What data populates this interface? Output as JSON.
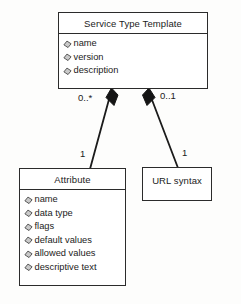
{
  "diagram": {
    "type": "uml-class-diagram",
    "background_color": "#fdfdfc",
    "line_color": "#2b2b2b",
    "text_color": "#1b1b1b",
    "classes": [
      {
        "id": "service-type-template",
        "name": "Service Type Template",
        "attributes": [
          "name",
          "version",
          "description"
        ]
      },
      {
        "id": "attribute",
        "name": "Attribute",
        "attributes": [
          "name",
          "data type",
          "flags",
          "default values",
          "allowed values",
          "descriptive text"
        ]
      },
      {
        "id": "url-syntax",
        "name": "URL syntax",
        "attributes": []
      }
    ],
    "associations": [
      {
        "id": "template-to-attribute",
        "kind": "composition",
        "source": "service-type-template",
        "target": "attribute",
        "source_multiplicity": "0..*",
        "target_multiplicity": "1"
      },
      {
        "id": "template-to-url-syntax",
        "kind": "composition",
        "source": "service-type-template",
        "target": "url-syntax",
        "source_multiplicity": "0..1",
        "target_multiplicity": "1"
      }
    ],
    "multiplicity_labels": {
      "template_attribute_end": "0..*",
      "template_url_end": "0..1",
      "attribute_end": "1",
      "url_syntax_end": "1"
    },
    "icons": {
      "attribute_bullet": "diamond-bullet-icon",
      "composition_end": "filled-diamond-icon"
    }
  }
}
